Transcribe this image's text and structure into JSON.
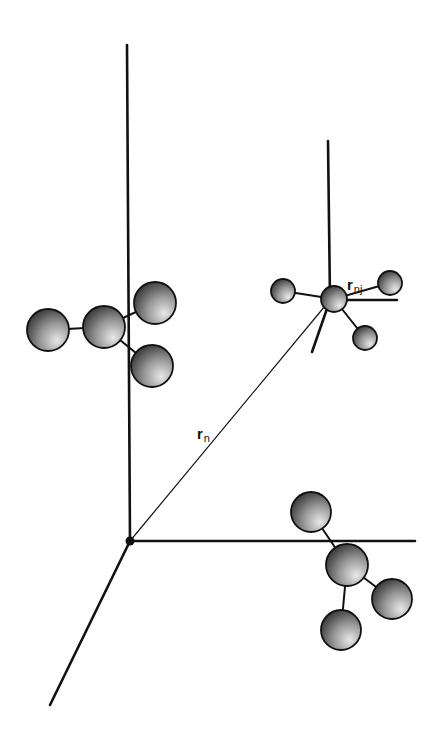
{
  "diagram": {
    "labels": {
      "r_n": {
        "main": "r",
        "sub": "n"
      },
      "r_nj": {
        "main": "r",
        "sub": "nj"
      }
    },
    "colors": {
      "line": "#111111",
      "sphere_light": "#e8e8e8",
      "sphere_dark": "#2a2a2a",
      "background": "#ffffff"
    },
    "global_frame": {
      "origin": [
        130,
        541
      ],
      "axes": [
        {
          "name": "vertical-axis",
          "from": [
            130,
            541
          ],
          "to": [
            127,
            45
          ]
        },
        {
          "name": "horizontal-axis",
          "from": [
            130,
            541
          ],
          "to": [
            415,
            541
          ]
        },
        {
          "name": "diagonal-axis",
          "from": [
            130,
            541
          ],
          "to": [
            50,
            705
          ]
        }
      ]
    },
    "local_frame": {
      "origin": [
        330,
        300
      ],
      "axes": [
        {
          "name": "local-vertical-axis",
          "from": [
            330,
            300
          ],
          "to": [
            328,
            141
          ]
        },
        {
          "name": "local-horizontal-axis",
          "from": [
            330,
            300
          ],
          "to": [
            397,
            300
          ]
        },
        {
          "name": "local-diagonal-axis",
          "from": [
            330,
            300
          ],
          "to": [
            312,
            352
          ]
        }
      ]
    },
    "vector_r_n": {
      "from": [
        130,
        541
      ],
      "to": [
        330,
        300
      ]
    },
    "molecules": [
      {
        "name": "molecule-left",
        "atoms": [
          {
            "cx": 48,
            "cy": 330,
            "r": 21
          },
          {
            "cx": 104,
            "cy": 327,
            "r": 21
          },
          {
            "cx": 155,
            "cy": 303,
            "r": 21
          },
          {
            "cx": 152,
            "cy": 366,
            "r": 21
          }
        ],
        "bonds": [
          [
            0,
            1
          ],
          [
            1,
            2
          ],
          [
            1,
            3
          ]
        ]
      },
      {
        "name": "molecule-local",
        "atoms": [
          {
            "cx": 283,
            "cy": 291,
            "r": 12
          },
          {
            "cx": 334,
            "cy": 299,
            "r": 13
          },
          {
            "cx": 390,
            "cy": 283,
            "r": 12
          },
          {
            "cx": 365,
            "cy": 338,
            "r": 12
          }
        ],
        "bonds": [
          [
            0,
            1
          ],
          [
            1,
            2
          ],
          [
            1,
            3
          ]
        ]
      },
      {
        "name": "molecule-bottom-right",
        "atoms": [
          {
            "cx": 311,
            "cy": 512,
            "r": 20
          },
          {
            "cx": 347,
            "cy": 565,
            "r": 21
          },
          {
            "cx": 392,
            "cy": 599,
            "r": 20
          },
          {
            "cx": 341,
            "cy": 630,
            "r": 20
          }
        ],
        "bonds": [
          [
            0,
            1
          ],
          [
            1,
            2
          ],
          [
            1,
            3
          ]
        ]
      }
    ]
  }
}
